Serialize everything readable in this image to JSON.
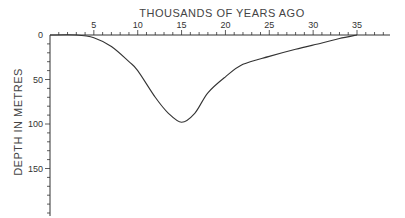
{
  "chart_data": {
    "type": "line",
    "title": "",
    "xlabel": "THOUSANDS OF YEARS AGO",
    "ylabel": "DEPTH IN METRES",
    "x_axis_position": "top",
    "y_inverted": true,
    "xlim": [
      0,
      37
    ],
    "ylim": [
      0,
      200
    ],
    "x_ticks": [
      5,
      10,
      15,
      20,
      25,
      30,
      35
    ],
    "y_ticks": [
      0,
      50,
      100,
      150
    ],
    "x_minor_step": 1,
    "y_minor_step": 10,
    "grid": false,
    "legend": null,
    "series": [
      {
        "name": "depth",
        "x": [
          0,
          3,
          5,
          7,
          9,
          10,
          12,
          13.5,
          15,
          16.5,
          18,
          20,
          22,
          25,
          28,
          31,
          33,
          35
        ],
        "values": [
          0,
          0,
          3,
          13,
          30,
          40,
          70,
          88,
          98,
          88,
          65,
          47,
          33,
          24,
          16,
          9,
          4,
          0
        ]
      }
    ]
  },
  "labels": {
    "x_title": "THOUSANDS OF YEARS AGO",
    "y_title": "DEPTH IN METRES"
  },
  "colors": {
    "line": "#333333",
    "axis": "#333333",
    "text": "#444444"
  }
}
